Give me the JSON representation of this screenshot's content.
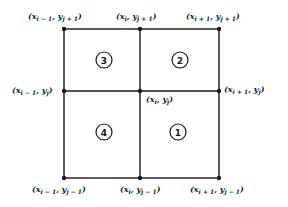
{
  "diagram": {
    "type": "grid-stencil",
    "colors": {
      "line": "#1a1a1a",
      "background": "#ffffff"
    },
    "points": {
      "top_left": {
        "x": "x",
        "x_sub": "i − 1",
        "y": "y",
        "y_sub": "j + 1"
      },
      "top_mid": {
        "x": "x",
        "x_sub": "i",
        "y": "y",
        "y_sub": "j + 1"
      },
      "top_right": {
        "x": "x",
        "x_sub": "i + 1",
        "y": "y",
        "y_sub": "j + 1"
      },
      "mid_left": {
        "x": "x",
        "x_sub": "i − 1",
        "y": "y",
        "y_sub": "j"
      },
      "center": {
        "x": "x",
        "x_sub": "i",
        "y": "y",
        "y_sub": "j"
      },
      "mid_right": {
        "x": "x",
        "x_sub": "i + 1",
        "y": "y",
        "y_sub": "j"
      },
      "bottom_left": {
        "x": "x",
        "x_sub": "i − 1",
        "y": "y",
        "y_sub": "j − 1"
      },
      "bottom_mid": {
        "x": "x",
        "x_sub": "i",
        "y": "y",
        "y_sub": "j − 1"
      },
      "bottom_right": {
        "x": "x",
        "x_sub": "i + 1",
        "y": "y",
        "y_sub": "j − 1"
      }
    },
    "cells": {
      "upper_left": "3",
      "upper_right": "2",
      "lower_left": "4",
      "lower_right": "1"
    },
    "punct": {
      "open": "(",
      "comma": ", ",
      "close": ")"
    }
  }
}
